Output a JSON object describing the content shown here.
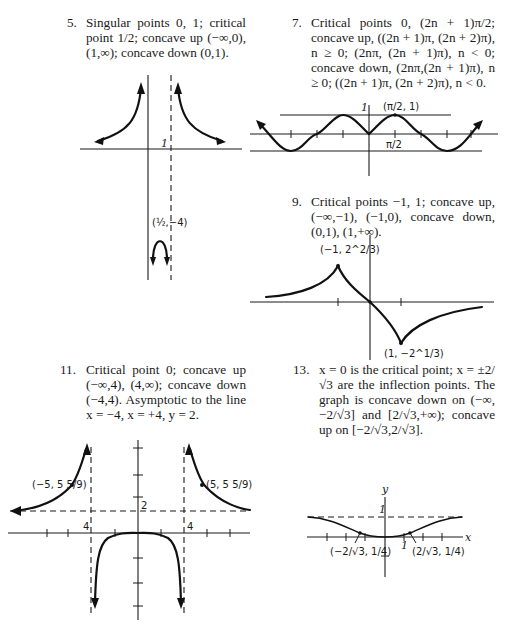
{
  "problems": [
    {
      "number": "5.",
      "text": "Singular points 0, 1; critical point 1/2; concave up (−∞,0), (1,∞); concave down (0,1).",
      "graph": {
        "labels": {
          "one": "1",
          "point": "(½,−4)"
        }
      }
    },
    {
      "number": "7.",
      "text": "Critical points 0, (2n + 1)π/2; concave up, ((2n + 1)π, (2n + 2)π), n ≥ 0; (2nπ, (2n + 1)π), n < 0; concave down, (2nπ,(2n + 1)π), n ≥ 0; ((2n + 1)π, (2n + 2)π), n < 0.",
      "graph": {
        "labels": {
          "one": "1",
          "point": "(π/2, 1)",
          "tick": "π/2"
        }
      }
    },
    {
      "number": "9.",
      "text": "Critical points −1, 1; concave up, (−∞,−1), (−1,0), concave down, (0,1), (1,+∞).",
      "graph": {
        "labels": {
          "max": "(−1, 2^2/3)",
          "min": "(1, −2^1/3)"
        }
      }
    },
    {
      "number": "11.",
      "text": "Critical point 0; concave up (−∞,4), (4,∞); concave down (−4,4). Asymptotic to the line x = −4, x = +4, y = 2.",
      "graph": {
        "labels": {
          "left_point": "(−5, 5 5/9)",
          "right_point": "(5, 5 5/9)",
          "y_asym": "2",
          "left_four": "4",
          "right_four": "4"
        }
      }
    },
    {
      "number": "13.",
      "text": "x = 0 is the critical point; x = ±2/√3 are the inflection points. The graph is concave down on (−∞,−2/√3] and [2/√3,+∞); concave up on [−2/√3,2/√3].",
      "graph": {
        "labels": {
          "y_axis": "y",
          "x_axis": "x",
          "one_y": "1",
          "one_x": "1",
          "left_inflection": "(−2/√3, 1/4)",
          "right_inflection": "(2/√3, 1/4)"
        }
      }
    }
  ]
}
